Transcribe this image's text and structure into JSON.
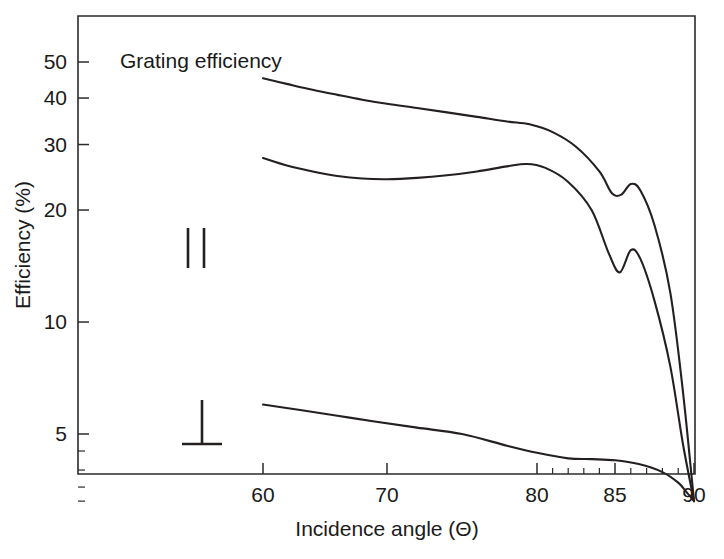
{
  "chart_data": {
    "type": "line",
    "title": "Grating efficiency",
    "xlabel": "Incidence angle (Θ)",
    "ylabel": "Efficiency (%)",
    "xlim": [
      55,
      90
    ],
    "ylim": [
      3,
      57
    ],
    "x_scale": "compressed-grazing",
    "y_scale": "log",
    "grid": false,
    "legend_position": "inside-left",
    "xticks": [
      60,
      70,
      80,
      85,
      90
    ],
    "xtick_labels": [
      "60",
      "70",
      "80",
      "85",
      "90"
    ],
    "x_minor_ticks": [
      81,
      82,
      83,
      84,
      86,
      87,
      88,
      89
    ],
    "yticks": [
      50,
      40,
      30,
      20,
      10,
      5
    ],
    "ytick_labels": [
      "50",
      "40",
      "30",
      "20",
      "10",
      "5"
    ],
    "y_minor_ticks": [
      4.5,
      4,
      3.6,
      3.3
    ],
    "series": [
      {
        "name": "total",
        "legend_symbol": "",
        "x": [
          60,
          62,
          64,
          66,
          68,
          70,
          72,
          74,
          76,
          78,
          79.5,
          81,
          82.5,
          84,
          84.8,
          85.4,
          86,
          86.6,
          87.5,
          88.5,
          89.3,
          90
        ],
        "values": [
          45.2,
          43.6,
          42.1,
          40.8,
          39.6,
          38.6,
          37.6,
          36.6,
          35.6,
          34.6,
          34.0,
          32.4,
          29.6,
          25.4,
          22.2,
          22.0,
          23.5,
          22.6,
          18.2,
          12.0,
          6.5,
          3.3
        ]
      },
      {
        "name": "parallel",
        "legend_symbol": "∥",
        "x": [
          60,
          62,
          64,
          66,
          68,
          70,
          72,
          74,
          76,
          78,
          79.3,
          80.5,
          82,
          83.5,
          84.6,
          85.3,
          86,
          86.6,
          87.5,
          88.5,
          89.3,
          90
        ],
        "values": [
          27.6,
          26.3,
          25.4,
          24.7,
          24.3,
          24.2,
          24.4,
          24.8,
          25.4,
          26.2,
          26.6,
          26.0,
          23.8,
          20.0,
          15.3,
          13.6,
          15.6,
          14.8,
          11.4,
          7.6,
          4.7,
          3.3
        ]
      },
      {
        "name": "perpendicular",
        "legend_symbol": "⊥",
        "x": [
          60,
          63,
          66,
          69,
          72,
          75,
          78,
          80,
          82,
          83.5,
          85,
          86.5,
          88,
          89,
          89.5,
          90
        ],
        "values": [
          6.0,
          5.8,
          5.6,
          5.4,
          5.2,
          5.0,
          4.65,
          4.45,
          4.3,
          4.28,
          4.25,
          4.15,
          3.95,
          3.7,
          3.5,
          3.3
        ]
      }
    ],
    "annotations": [
      {
        "text": "Grating efficiency",
        "x_px": 120,
        "y_px": 60
      }
    ],
    "legend_marks": [
      {
        "symbol": "∥",
        "name": "parallel-polarization-symbol",
        "x_px": 196,
        "y_px": 248
      },
      {
        "symbol": "⊥",
        "name": "perpendicular-polarization-symbol",
        "x_px": 202,
        "y_px": 422
      }
    ],
    "colors": {
      "curve": "#23201f",
      "axis": "#2b2b2b",
      "text": "#1a1a1a",
      "background": "#ffffff"
    }
  }
}
